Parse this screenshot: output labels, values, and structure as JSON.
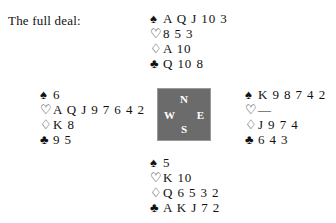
{
  "caption": "The full deal:",
  "suits": {
    "spade": {
      "glyph": "♠",
      "name": "spade-symbol",
      "style": "black"
    },
    "heart": {
      "glyph": "♡",
      "name": "heart-symbol",
      "style": "hollow"
    },
    "diamond": {
      "glyph": "♢",
      "name": "diamond-symbol",
      "style": "hollow"
    },
    "club": {
      "glyph": "♣",
      "name": "club-symbol",
      "style": "black"
    }
  },
  "hands": {
    "north": {
      "position": "North",
      "spades": "A Q J 10 3",
      "hearts": "8 5 3",
      "diamonds": "A 10",
      "clubs": "Q 10 8"
    },
    "west": {
      "position": "West",
      "spades": "6",
      "hearts": "A Q J 9 7 6 4 2",
      "diamonds": "K 8",
      "clubs": "9 5"
    },
    "east": {
      "position": "East",
      "spades": "K 9 8 7 4 2",
      "hearts": "—",
      "diamonds": "J 9 7 4",
      "clubs": "6 4 3"
    },
    "south": {
      "position": "South",
      "spades": "5",
      "hearts": "K 10",
      "diamonds": "Q 6 5 3 2",
      "clubs": "A K J 7 2"
    }
  },
  "compass": {
    "north": "N",
    "west": "W",
    "east": "E",
    "south": "S",
    "fill_color": "#6b6b6b",
    "text_color": "#ffffff"
  }
}
